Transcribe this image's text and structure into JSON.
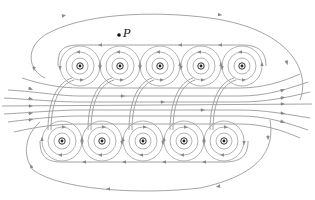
{
  "figure": {
    "point_label": "P",
    "point": {
      "x": 119,
      "y": 35
    },
    "colors": {
      "field_line": "#9a9a9a",
      "conductor": "#222222",
      "background": "#ffffff"
    },
    "top_conductors": {
      "symbol": "dot (current out of page)",
      "y": 66,
      "x": [
        80,
        120,
        160,
        201,
        242
      ]
    },
    "bottom_conductors": {
      "symbol": "cross (current into page)",
      "y": 141,
      "x": [
        62,
        102,
        143,
        184,
        224
      ]
    },
    "field_direction": "left-to-right inside solenoid, returning right-to-left outside"
  }
}
